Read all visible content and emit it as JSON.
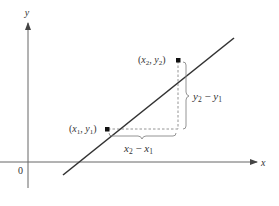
{
  "diagram": {
    "type": "slope-of-line",
    "axes": {
      "x_label": "x",
      "y_label": "y",
      "origin_label": "0"
    },
    "points": [
      {
        "name": "P1",
        "label_x": "x",
        "label_x_sub": "1",
        "label_y": "y",
        "label_y_sub": "1"
      },
      {
        "name": "P2",
        "label_x": "x",
        "label_x_sub": "2",
        "label_y": "y",
        "label_y_sub": "2"
      }
    ],
    "rise_label": {
      "a": "y",
      "a_sub": "2",
      "op": "−",
      "b": "y",
      "b_sub": "1"
    },
    "run_label": {
      "a": "x",
      "a_sub": "2",
      "op": "−",
      "b": "x",
      "b_sub": "1"
    },
    "colors": {
      "line": "#333333",
      "axis": "#555555",
      "dashed": "#777777",
      "brace": "#777777"
    }
  }
}
